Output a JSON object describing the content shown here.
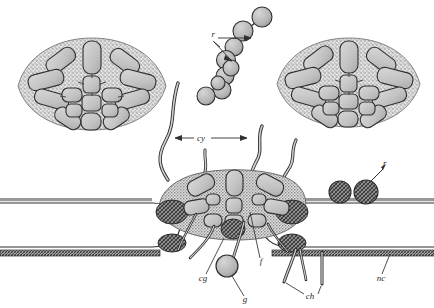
{
  "figure": {
    "type": "scientific-line-drawing",
    "background_color": "#ffffff",
    "ink_color": "#2b2b2b",
    "fill_light": "#c9c9c9",
    "fill_mid": "#a8a8a8",
    "fill_dark": "#6e6e6e",
    "stipple_color": "#8d8d8d",
    "width": 434,
    "height": 308
  },
  "labels": [
    {
      "id": "cy",
      "text": "cy",
      "meaning": "cilium",
      "x": 201,
      "y": 141,
      "leader": "double-arrow-horizontal"
    },
    {
      "id": "r-top",
      "text": "r",
      "meaning": "rootlet",
      "x": 215,
      "y": 37,
      "leader": "two-arrows"
    },
    {
      "id": "cg",
      "text": "cg",
      "meaning": "cap cell / ciliary granule",
      "x": 203,
      "y": 281,
      "leader": "line"
    },
    {
      "id": "g",
      "text": "g",
      "meaning": "gland cell",
      "x": 245,
      "y": 302,
      "leader": "line"
    },
    {
      "id": "f",
      "text": "f",
      "meaning": "fibre",
      "x": 261,
      "y": 264,
      "leader": "line"
    },
    {
      "id": "ch",
      "text": "ch",
      "meaning": "chordotonal / chaetae",
      "x": 310,
      "y": 299,
      "leader": "two-lines"
    },
    {
      "id": "nc",
      "text": "nc",
      "meaning": "nerve cord",
      "x": 381,
      "y": 281,
      "leader": "line"
    },
    {
      "id": "r-right",
      "text": "r",
      "meaning": "rootlet",
      "x": 383,
      "y": 166,
      "leader": "line"
    }
  ],
  "structures": {
    "left_rosette": {
      "name": "left ciliary rosette (cross-section)",
      "center_x": 92,
      "center_y": 85,
      "radius_x": 74,
      "radius_y": 47
    },
    "right_rosette": {
      "name": "right ciliary rosette (cross-section)",
      "center_x": 348,
      "center_y": 83,
      "radius_x": 72,
      "radius_y": 45
    },
    "sphere_chain": {
      "name": "chain of rootlet granules",
      "count": 9
    },
    "central_body": {
      "name": "central sensory body",
      "center_x": 236,
      "center_y": 196
    },
    "left_tube": {
      "name": "left nerve cord tube"
    },
    "right_tube": {
      "name": "right nerve cord tube"
    },
    "rootlet_spheres": {
      "name": "dark rootlet granules",
      "count": 2
    }
  }
}
